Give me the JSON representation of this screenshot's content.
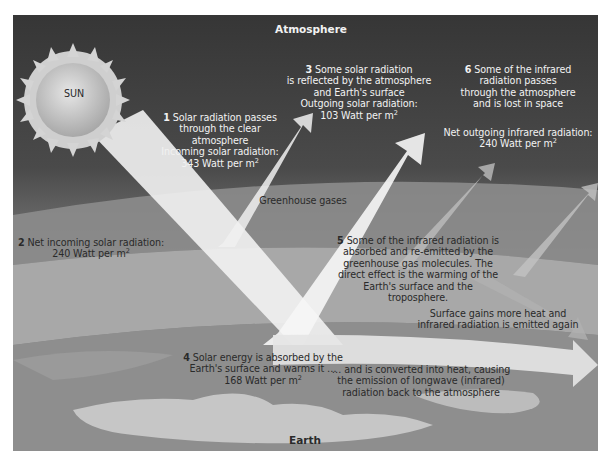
{
  "diagram": {
    "title_top": "Atmosphere",
    "title_bottom": "Earth",
    "sun_label": "SUN",
    "unit_suffix": "2",
    "steps": [
      {
        "num": "1",
        "lines": [
          "Solar radiation passes",
          "through the clear",
          "atmosphere",
          "Incoming solar radiation:",
          "343 Watt per m"
        ]
      },
      {
        "num": "2",
        "lines": [
          "Net incoming solar radiation:",
          "240 Watt per m"
        ]
      },
      {
        "num": "3",
        "lines": [
          "Some solar radiation",
          "is reflected by the atmosphere",
          "and Earth's surface",
          "Outgoing solar radiation:",
          "103 Watt per m"
        ]
      },
      {
        "num": "4",
        "lines": [
          "Solar energy is absorbed by the",
          "Earth's surface and warms it …",
          "168 Watt per m"
        ]
      },
      {
        "num": "5",
        "lines": [
          "Some of the infrared radiation is",
          "absorbed and re-emitted by the",
          "greenhouse gas molecules. The",
          "direct effect is the warming of the",
          "Earth's surface and the troposphere."
        ]
      },
      {
        "num": "6",
        "lines": [
          "Some of the infrared",
          "radiation passes",
          "through the atmosphere",
          "and is lost in space"
        ]
      }
    ],
    "net_outgoing": [
      "Net outgoing infrared radiation:",
      "240 Watt per m"
    ],
    "greenhouse_label": "Greenhouse gases",
    "surface_gains": [
      "Surface gains more heat and",
      "infrared radiation is emitted again"
    ],
    "converted": [
      "… and is converted into heat, causing",
      "the emission of longwave (infrared)",
      "radiation back to the atmosphere"
    ],
    "colors": {
      "space_dark": "#3a3a3a",
      "band_light": "#a9a9a9",
      "band_dark": "#8a8a8a",
      "beam": "#f4f4f4",
      "ground": "#9c9c9c",
      "land": "#c9c9c9"
    }
  }
}
